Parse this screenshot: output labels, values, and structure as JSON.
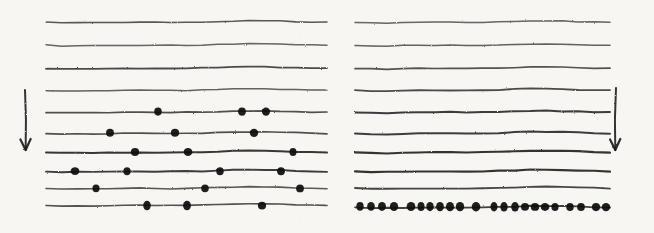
{
  "figure": {
    "width": 654,
    "height": 233,
    "background_color": "#f7f6f3",
    "ink_color": "#1a1a1a",
    "style": "scanned hand-drawn ink on paper"
  },
  "chart_data": {
    "type": "scatter",
    "title": "",
    "subtitle": "",
    "xlabel": "",
    "ylabel": "",
    "grid": false,
    "legend": null,
    "annotations": [
      {
        "name": "left-direction-arrow",
        "kind": "arrow",
        "direction": "down",
        "x": 25,
        "y_start": 90,
        "y_end": 150,
        "label": ""
      },
      {
        "name": "right-direction-arrow",
        "kind": "arrow",
        "direction": "down",
        "x": 616,
        "y_start": 88,
        "y_end": 150,
        "label": ""
      }
    ],
    "panels": [
      {
        "name": "left-panel",
        "x_start": 46,
        "x_end": 327,
        "line_count": 10,
        "marker_shape": "filled-circle",
        "marker_color": "#111111",
        "description": "ten wavy horizontal lines; upper four lines carry no markers, lower six lines carry sparse irregularly spaced markers",
        "lines": [
          {
            "index": 1,
            "y": 22,
            "thickness": 1.6,
            "darkness": 0.72,
            "dots": []
          },
          {
            "index": 2,
            "y": 45,
            "thickness": 1.5,
            "darkness": 0.66,
            "dots": []
          },
          {
            "index": 3,
            "y": 68,
            "thickness": 1.8,
            "darkness": 0.78,
            "dots": []
          },
          {
            "index": 4,
            "y": 90,
            "thickness": 1.5,
            "darkness": 0.68,
            "dots": []
          },
          {
            "index": 5,
            "y": 112,
            "thickness": 1.7,
            "darkness": 0.76,
            "dots": [
              158,
              242,
              266
            ]
          },
          {
            "index": 6,
            "y": 133,
            "thickness": 1.7,
            "darkness": 0.76,
            "dots": [
              110,
              175,
              254
            ]
          },
          {
            "index": 7,
            "y": 152,
            "thickness": 2.0,
            "darkness": 0.86,
            "dots": [
              135,
              188,
              293
            ]
          },
          {
            "index": 8,
            "y": 171,
            "thickness": 1.9,
            "darkness": 0.84,
            "dots": [
              75,
              127,
              220,
              281
            ]
          },
          {
            "index": 9,
            "y": 188,
            "thickness": 1.6,
            "darkness": 0.72,
            "dots": [
              96,
              205,
              300
            ]
          },
          {
            "index": 10,
            "y": 205,
            "thickness": 1.6,
            "darkness": 0.74,
            "dots": [
              147,
              187,
              262
            ]
          }
        ]
      },
      {
        "name": "right-panel",
        "x_start": 355,
        "x_end": 610,
        "line_count": 10,
        "marker_shape": "filled-circle",
        "marker_color": "#111111",
        "description": "ten wavy horizontal lines growing progressively thicker and darker toward the bottom; only the lowest line carries markers, as a dense saturated row",
        "lines": [
          {
            "index": 1,
            "y": 22,
            "thickness": 1.5,
            "darkness": 0.66,
            "dots": []
          },
          {
            "index": 2,
            "y": 45,
            "thickness": 1.5,
            "darkness": 0.68,
            "dots": []
          },
          {
            "index": 3,
            "y": 68,
            "thickness": 1.7,
            "darkness": 0.74,
            "dots": []
          },
          {
            "index": 4,
            "y": 90,
            "thickness": 1.8,
            "darkness": 0.78,
            "dots": []
          },
          {
            "index": 5,
            "y": 112,
            "thickness": 2.0,
            "darkness": 0.84,
            "dots": []
          },
          {
            "index": 6,
            "y": 133,
            "thickness": 2.0,
            "darkness": 0.84,
            "dots": []
          },
          {
            "index": 7,
            "y": 152,
            "thickness": 2.1,
            "darkness": 0.88,
            "dots": []
          },
          {
            "index": 8,
            "y": 171,
            "thickness": 2.1,
            "darkness": 0.88,
            "dots": []
          },
          {
            "index": 9,
            "y": 188,
            "thickness": 1.8,
            "darkness": 0.8,
            "dots": []
          },
          {
            "index": 10,
            "y": 207,
            "thickness": 1.8,
            "darkness": 0.82,
            "dots": [
              360,
              371,
              382,
              394,
              411,
              421,
              430,
              440,
              450,
              460,
              476,
              494,
              504,
              515,
              525,
              535,
              545,
              555,
              570,
              581,
              596,
              606
            ]
          }
        ]
      }
    ]
  }
}
